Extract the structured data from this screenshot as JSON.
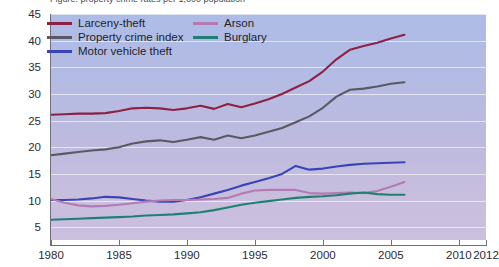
{
  "title_sliver": "Figure: property crime rates per 1,000 population",
  "axes": {
    "y_label": "",
    "y_ticks": [
      5,
      10,
      15,
      20,
      25,
      30,
      35,
      40,
      45
    ],
    "y_min": 2.6,
    "y_max": 45,
    "x_label": "",
    "x_ticks": [
      1980,
      1985,
      1990,
      1995,
      2000,
      2005,
      2010,
      2012
    ],
    "x_min": 1980,
    "x_max": 2012
  },
  "legend": {
    "position": "top-left-inside",
    "entries": [
      {
        "label": "Larceny-theft",
        "color": "#8e2044",
        "col": 0,
        "row": 0
      },
      {
        "label": "Property crime index",
        "color": "#595963",
        "col": 0,
        "row": 1
      },
      {
        "label": "Motor vehicle theft",
        "color": "#3a44b4",
        "col": 0,
        "row": 2
      },
      {
        "label": "Arson",
        "color": "#b47ab4",
        "col": 1,
        "row": 0
      },
      {
        "label": "Burglary",
        "color": "#1f8072",
        "col": 1,
        "row": 1
      }
    ]
  },
  "colors": {
    "plot_bg_top": "#adbce6",
    "plot_bg_bottom": "#ccbfe0",
    "gridline": "#ffffff",
    "axis": "#6f6f7a",
    "text": "#2b2b33"
  },
  "chart_data": {
    "type": "line",
    "title": "",
    "xlabel": "",
    "ylabel": "",
    "xlim": [
      1980,
      2012
    ],
    "ylim": [
      2.6,
      45
    ],
    "grid": true,
    "legend_position": "top-left-inside",
    "x": [
      1980,
      1981,
      1982,
      1983,
      1984,
      1985,
      1986,
      1987,
      1988,
      1989,
      1990,
      1991,
      1992,
      1993,
      1994,
      1995,
      1996,
      1997,
      1998,
      1999,
      2000,
      2001,
      2002,
      2003,
      2004,
      2005,
      2006
    ],
    "series": [
      {
        "name": "Larceny-theft",
        "color": "#8e2044",
        "values": [
          26.1,
          26.2,
          26.3,
          26.3,
          26.4,
          26.8,
          27.3,
          27.4,
          27.3,
          27.0,
          27.3,
          27.8,
          27.2,
          28.1,
          27.5,
          28.2,
          29.0,
          30.0,
          31.2,
          32.4,
          34.2,
          36.5,
          38.3,
          39.0,
          39.6,
          40.4,
          41.1
        ]
      },
      {
        "name": "Property crime index",
        "color": "#595963",
        "values": [
          18.5,
          18.8,
          19.1,
          19.4,
          19.6,
          20.0,
          20.7,
          21.1,
          21.3,
          21.0,
          21.4,
          21.9,
          21.4,
          22.2,
          21.7,
          22.2,
          22.9,
          23.6,
          24.7,
          25.8,
          27.4,
          29.5,
          30.8,
          31.0,
          31.4,
          31.9,
          32.2
        ]
      },
      {
        "name": "Motor vehicle theft",
        "color": "#3a44b4",
        "values": [
          10.1,
          10.1,
          10.2,
          10.4,
          10.7,
          10.6,
          10.3,
          10.0,
          9.8,
          9.8,
          10.1,
          10.6,
          11.3,
          12.0,
          12.8,
          13.5,
          14.2,
          15.0,
          16.5,
          15.8,
          16.0,
          16.4,
          16.7,
          16.9,
          17.0,
          17.1,
          17.2
        ]
      },
      {
        "name": "Arson",
        "color": "#b47ab4",
        "values": [
          10.3,
          9.6,
          9.1,
          8.9,
          9.0,
          9.2,
          9.5,
          9.8,
          10.0,
          10.1,
          10.1,
          10.2,
          10.3,
          10.5,
          11.3,
          11.9,
          12.0,
          12.0,
          12.0,
          11.4,
          11.3,
          11.4,
          11.5,
          11.4,
          11.8,
          12.6,
          13.5
        ]
      },
      {
        "name": "Burglary",
        "color": "#1f8072",
        "values": [
          6.4,
          6.5,
          6.6,
          6.7,
          6.8,
          6.9,
          7.0,
          7.2,
          7.3,
          7.4,
          7.6,
          7.8,
          8.2,
          8.7,
          9.2,
          9.6,
          9.9,
          10.2,
          10.5,
          10.7,
          10.8,
          11.0,
          11.3,
          11.5,
          11.2,
          11.1,
          11.1
        ]
      }
    ]
  }
}
